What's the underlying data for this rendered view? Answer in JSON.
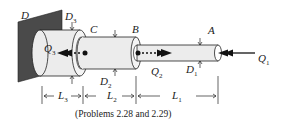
{
  "diagram": {
    "labels": {
      "D": "D",
      "D3": "D",
      "D3_sub": "3",
      "C": "C",
      "B": "B",
      "A": "A",
      "Q3": "Q",
      "Q3_sub": "3",
      "Q2": "Q",
      "Q2_sub": "2",
      "Q1": "Q",
      "Q1_sub": "1",
      "D2": "D",
      "D2_sub": "2",
      "D1": "D",
      "D1_sub": "1",
      "L3": "L",
      "L3_sub": "3",
      "L2": "L",
      "L2_sub": "2",
      "L1": "L",
      "L1_sub": "1"
    },
    "caption": "(Problems 2.28 and 2.29)",
    "colors": {
      "wall": "#4a4a4a",
      "pipe_fill": "#ececec",
      "stroke": "#222222"
    }
  }
}
